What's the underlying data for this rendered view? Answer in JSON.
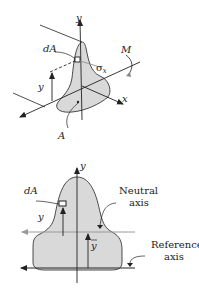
{
  "top_diagram": {
    "labels": {
      "y_axis": "y",
      "x_axis": "x",
      "dA": "dA",
      "moment": "M",
      "stress": "σ",
      "stress_sub": "x",
      "y_dist": "y",
      "area": "A"
    }
  },
  "bottom_diagram": {
    "labels": {
      "y_axis": "y",
      "dA": "dA",
      "y_dist": "y",
      "y_bar": "y",
      "neutral_line1": "Neutral",
      "neutral_line2": "axis",
      "reference_line1": "Reference",
      "reference_line2": "axis"
    }
  },
  "colors": {
    "fill": "#d9d9d9",
    "stroke": "#222222",
    "neutral_axis": "#9a9a9a"
  }
}
